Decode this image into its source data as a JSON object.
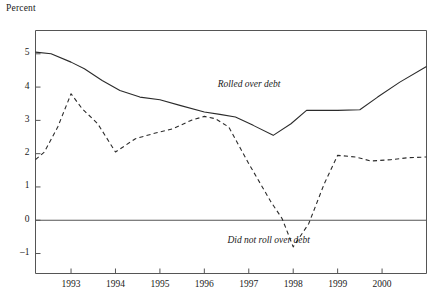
{
  "chart_data": {
    "type": "line",
    "title": "",
    "ylabel": "Percent",
    "xlabel": "",
    "ylim": [
      -1.6,
      5.7
    ],
    "xlim": [
      1992.2,
      2001.0
    ],
    "grid": false,
    "legend_position": "inline-annotations",
    "y_ticks": [
      -1,
      0,
      1,
      2,
      3,
      4,
      5
    ],
    "y_tick_labels": [
      "–1",
      "0",
      "1",
      "2",
      "3",
      "4",
      "5"
    ],
    "x_ticks": [
      1993,
      1994,
      1995,
      1996,
      1997,
      1998,
      1999,
      2000
    ],
    "x_tick_labels": [
      "1993",
      "1994",
      "1995",
      "1996",
      "1997",
      "1998",
      "1999",
      "2000"
    ],
    "zero_line": 0,
    "series": [
      {
        "name": "Rolled over debt",
        "style": "solid",
        "color": "#2b2b2b",
        "label_x": 1996.3,
        "label_y": 4.05,
        "points": [
          [
            1992.2,
            5.05
          ],
          [
            1992.55,
            5.0
          ],
          [
            1993.0,
            4.75
          ],
          [
            1993.3,
            4.55
          ],
          [
            1993.7,
            4.2
          ],
          [
            1994.1,
            3.9
          ],
          [
            1994.55,
            3.7
          ],
          [
            1995.0,
            3.62
          ],
          [
            1995.45,
            3.45
          ],
          [
            1996.0,
            3.25
          ],
          [
            1996.35,
            3.18
          ],
          [
            1996.7,
            3.1
          ],
          [
            1997.1,
            2.85
          ],
          [
            1997.55,
            2.55
          ],
          [
            1997.95,
            2.9
          ],
          [
            1998.3,
            3.3
          ],
          [
            1999.0,
            3.3
          ],
          [
            1999.5,
            3.32
          ],
          [
            1999.9,
            3.7
          ],
          [
            2000.4,
            4.15
          ],
          [
            2001.0,
            4.62
          ]
        ]
      },
      {
        "name": "Did not roll over debt",
        "style": "dashed",
        "color": "#2b2b2b",
        "label_x": 1997.6,
        "label_y": -0.62,
        "points": [
          [
            1992.2,
            1.82
          ],
          [
            1992.4,
            2.05
          ],
          [
            1992.7,
            2.8
          ],
          [
            1993.0,
            3.8
          ],
          [
            1993.25,
            3.35
          ],
          [
            1993.6,
            2.9
          ],
          [
            1994.0,
            2.05
          ],
          [
            1994.45,
            2.45
          ],
          [
            1994.9,
            2.62
          ],
          [
            1995.3,
            2.75
          ],
          [
            1995.7,
            3.0
          ],
          [
            1996.0,
            3.12
          ],
          [
            1996.25,
            3.05
          ],
          [
            1996.55,
            2.8
          ],
          [
            1997.0,
            1.7
          ],
          [
            1997.5,
            0.55
          ],
          [
            1997.75,
            0.05
          ],
          [
            1998.0,
            -0.8
          ],
          [
            1998.35,
            -0.1
          ],
          [
            1998.7,
            1.1
          ],
          [
            1999.0,
            1.95
          ],
          [
            1999.4,
            1.9
          ],
          [
            1999.75,
            1.78
          ],
          [
            2000.2,
            1.82
          ],
          [
            2000.6,
            1.88
          ],
          [
            2001.0,
            1.9
          ]
        ]
      }
    ]
  },
  "labels": {
    "percent": "Percent",
    "rolled_over": "Rolled over debt",
    "did_not_roll_over": "Did not roll over debt"
  },
  "colors": {
    "line": "#2b2b2b",
    "frame": "#555555",
    "background": "#ffffff"
  }
}
